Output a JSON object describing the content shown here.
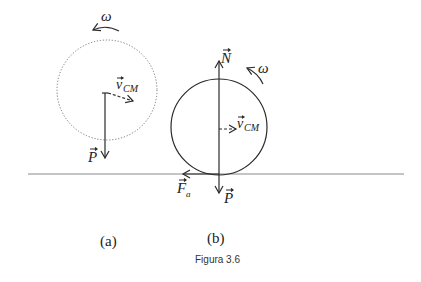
{
  "figure": {
    "caption": "Figura 3.6",
    "panels": [
      {
        "label": "(a)",
        "omega_label": "ω",
        "vcm_symbol": "v",
        "vcm_subscript": "CM",
        "weight_symbol": "P",
        "circle_style": "dotted"
      },
      {
        "label": "(b)",
        "omega_label": "ω",
        "normal_symbol": "N",
        "vcm_symbol": "v",
        "vcm_subscript": "CM",
        "weight_symbol": "P",
        "friction_symbol": "F",
        "friction_subscript": "a",
        "circle_style": "solid"
      }
    ],
    "colors": {
      "stroke": "#2a2a2a",
      "dotted_circle": "#777777",
      "ground": "#8a8a8a",
      "text": "#222222"
    }
  }
}
